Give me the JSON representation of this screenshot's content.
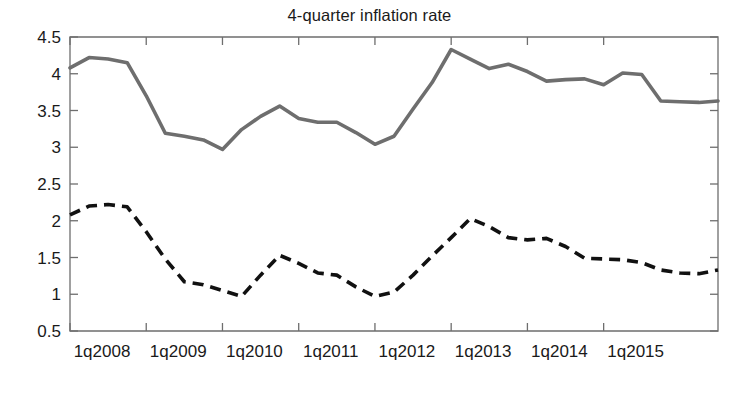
{
  "chart_data": {
    "type": "line",
    "title": "4-quarter inflation rate",
    "xlabel": "",
    "ylabel": "",
    "ylim": [
      0.5,
      4.5
    ],
    "ytick_labels": [
      "0.5",
      "1",
      "1.5",
      "2",
      "2.5",
      "3",
      "3.5",
      "4",
      "4.5"
    ],
    "ytick_values": [
      0.5,
      1,
      1.5,
      2,
      2.5,
      3,
      3.5,
      4,
      4.5
    ],
    "xtick_labels": [
      "1q2008",
      "1q2009",
      "1q2010",
      "1q2011",
      "1q2012",
      "1q2013",
      "1q2014",
      "1q2015"
    ],
    "xtick_values": [
      "2008q1",
      "2009q1",
      "2010q1",
      "2011q1",
      "2012q1",
      "2013q1",
      "2014q1",
      "2015q1"
    ],
    "grid": false,
    "legend": "none",
    "x": [
      "2008q1",
      "2008q2",
      "2008q3",
      "2008q4",
      "2009q1",
      "2009q2",
      "2009q3",
      "2009q4",
      "2010q1",
      "2010q2",
      "2010q3",
      "2010q4",
      "2011q1",
      "2011q2",
      "2011q3",
      "2011q4",
      "2012q1",
      "2012q2",
      "2012q3",
      "2012q4",
      "2013q1",
      "2013q2",
      "2013q3",
      "2013q4",
      "2014q1",
      "2014q2",
      "2014q3",
      "2014q4",
      "2015q1",
      "2015q2",
      "2015q3",
      "2015q4"
    ],
    "series": [
      {
        "name": "solid-gray-series",
        "style": "solid",
        "color": "#6e6e6e",
        "values": [
          4.08,
          4.22,
          4.2,
          4.15,
          3.7,
          3.19,
          3.15,
          3.1,
          2.97,
          3.24,
          3.42,
          3.56,
          3.39,
          3.34,
          3.34,
          3.2,
          3.04,
          3.15,
          3.52,
          3.88,
          4.33,
          4.2,
          4.07,
          4.13,
          4.03,
          3.9,
          3.92,
          3.93,
          3.85,
          4.01,
          3.99,
          3.63
        ]
      },
      {
        "name": "dashed-black-series",
        "style": "dashed",
        "color": "#111111",
        "values": [
          2.08,
          2.2,
          2.22,
          2.19,
          1.85,
          1.48,
          1.17,
          1.13,
          1.05,
          0.97,
          1.26,
          1.53,
          1.42,
          1.29,
          1.26,
          1.1,
          0.97,
          1.03,
          1.26,
          1.52,
          1.77,
          2.03,
          1.92,
          1.77,
          1.74,
          1.76,
          1.65,
          1.49,
          1.48,
          1.47,
          1.43,
          1.33
        ]
      }
    ],
    "series_extra_points": {
      "solid-gray-series": [
        3.62,
        3.61,
        3.63
      ],
      "dashed-black-series": [
        1.29,
        1.28,
        1.33
      ]
    }
  },
  "axes": {
    "box_color": "#6e6e6e",
    "background": "#ffffff"
  }
}
